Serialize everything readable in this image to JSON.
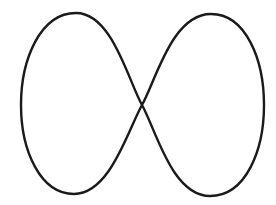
{
  "figure": {
    "shape": "figure-eight-curve",
    "stroke_color": "#1a1a1a",
    "background_color": "#ffffff",
    "stroke_width": 2.4
  }
}
